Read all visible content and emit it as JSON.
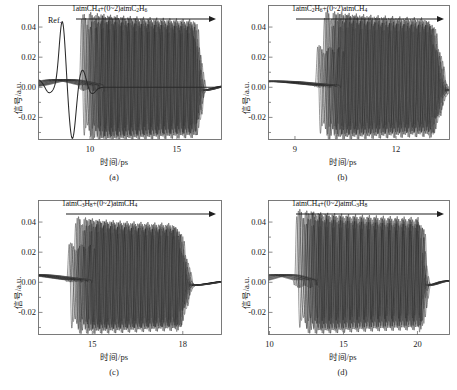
{
  "figure": {
    "type": "multi-panel-line-chart",
    "panels_layout": "2x2",
    "background": "#ffffff",
    "line_color": "#4a4a4a",
    "axis_color": "#6d6d6d"
  },
  "common": {
    "ylabel": "信号/a.u.",
    "xlabel": "时间/ps",
    "yticks": [
      "0.04",
      "0.02",
      "0.00",
      "-0.02"
    ],
    "ytick_values": [
      0.04,
      0.02,
      0.0,
      -0.02
    ],
    "ylim": [
      -0.035,
      0.05
    ],
    "reference_label": "Ref."
  },
  "panels": [
    {
      "tag": "(a)",
      "annotation": "1atmCH4+(0~2)atmC2H6",
      "annotation_parts": [
        {
          "t": "1atmCH"
        },
        {
          "t": "4",
          "sub": true
        },
        {
          "t": "+(0~2)atmC"
        },
        {
          "t": "2",
          "sub": true
        },
        {
          "t": "H"
        },
        {
          "t": "6",
          "sub": true
        }
      ],
      "xticks": [
        "10",
        "15"
      ],
      "xtick_values": [
        10,
        15
      ],
      "xlim": [
        7.0,
        17.6
      ],
      "has_reference": true,
      "reference_peak_time": 8.4,
      "burst_start": 9.3,
      "burst_span": [
        9.3,
        16.2
      ],
      "n_traces": 18,
      "trace_shift_per_step": 0.085,
      "osc_period_ps": 0.38,
      "amp_positive": 0.044,
      "amp_negative": -0.032,
      "precursor_bump": 0.005
    },
    {
      "tag": "(b)",
      "annotation": "1atmC2H6+(0~2)atmCH4",
      "annotation_parts": [
        {
          "t": "1atmC"
        },
        {
          "t": "2",
          "sub": true
        },
        {
          "t": "H"
        },
        {
          "t": "6",
          "sub": true
        },
        {
          "t": "+(0~2)atmCH"
        },
        {
          "t": "4",
          "sub": true
        }
      ],
      "xticks": [
        "9",
        "12"
      ],
      "xtick_values": [
        9,
        12
      ],
      "xlim": [
        8.2,
        13.6
      ],
      "has_reference": false,
      "burst_start": 9.55,
      "burst_span": [
        9.55,
        13.1
      ],
      "n_traces": 18,
      "trace_shift_per_step": 0.045,
      "osc_period_ps": 0.215,
      "amp_positive": 0.045,
      "amp_negative": -0.031,
      "precursor_bump": 0.004
    },
    {
      "tag": "(c)",
      "annotation": "1atmC3H8+(0~2)atmCH4",
      "annotation_parts": [
        {
          "t": "1atmC"
        },
        {
          "t": "3",
          "sub": true
        },
        {
          "t": "H"
        },
        {
          "t": "8",
          "sub": true
        },
        {
          "t": "+(0~2)atmCH"
        },
        {
          "t": "4",
          "sub": true
        }
      ],
      "xticks": [
        "15",
        "18"
      ],
      "xtick_values": [
        15,
        18
      ],
      "xlim": [
        13.2,
        19.3
      ],
      "has_reference": false,
      "burst_start": 14.1,
      "burst_span": [
        14.1,
        17.9
      ],
      "n_traces": 18,
      "trace_shift_per_step": 0.05,
      "osc_period_ps": 0.23,
      "amp_positive": 0.038,
      "amp_negative": -0.031,
      "precursor_bump": 0.005
    },
    {
      "tag": "(d)",
      "annotation": "1atmCH4+(0~2)atmC3H8",
      "annotation_parts": [
        {
          "t": "1atmCH"
        },
        {
          "t": "4",
          "sub": true
        },
        {
          "t": "+(0~2)atmC"
        },
        {
          "t": "3",
          "sub": true
        },
        {
          "t": "H"
        },
        {
          "t": "8",
          "sub": true
        }
      ],
      "xticks": [
        "10",
        "15",
        "20"
      ],
      "xtick_values": [
        10,
        15,
        20
      ],
      "xlim": [
        9.9,
        22.2
      ],
      "has_reference": false,
      "burst_start": 11.6,
      "burst_span": [
        11.6,
        20.4
      ],
      "n_traces": 16,
      "trace_shift_per_step": 0.11,
      "osc_period_ps": 0.47,
      "amp_positive": 0.042,
      "amp_negative": -0.03,
      "precursor_bump": 0.005
    }
  ],
  "chart_data": {
    "type": "line",
    "title": "",
    "xlabel": "时间/ps",
    "ylabel": "信号/a.u.",
    "ylim": [
      -0.035,
      0.05
    ],
    "grid": false,
    "legend": "none",
    "subplots": [
      {
        "tag": "(a)",
        "annotation": "1atmCH4+(0~2)atmC2H6",
        "xlim": [
          7.0,
          17.6
        ],
        "xticks": [
          10,
          15
        ],
        "yticks": [
          0.04,
          0.02,
          0.0,
          -0.02
        ],
        "series_count": 18,
        "series_description": "Overlaid THz time-domain waveforms; each trace corresponds to an increasing buffer-gas pressure from 0 to 2 atm, producing a progressive time delay of the free-induction-decay oscillation burst.",
        "reference_trace": {
          "name": "Ref.",
          "peak_time_ps": 8.4,
          "peak_amplitude": 0.044,
          "trough_time_ps": 9.0,
          "trough_amplitude": -0.034
        },
        "burst_onset_ps": 9.3,
        "burst_end_ps": 16.2,
        "oscillation_period_ps": 0.38,
        "amplitude_max": 0.044,
        "amplitude_min": -0.032
      },
      {
        "tag": "(b)",
        "annotation": "1atmC2H6+(0~2)atmCH4",
        "xlim": [
          8.2,
          13.6
        ],
        "xticks": [
          9,
          12
        ],
        "yticks": [
          0.04,
          0.02,
          0.0,
          -0.02
        ],
        "series_count": 18,
        "series_description": "Overlaid THz waveforms with increasing CH4 pressure added to 1 atm C2H6.",
        "burst_onset_ps": 9.55,
        "burst_end_ps": 13.1,
        "oscillation_period_ps": 0.215,
        "amplitude_max": 0.045,
        "amplitude_min": -0.031
      },
      {
        "tag": "(c)",
        "annotation": "1atmC3H8+(0~2)atmCH4",
        "xlim": [
          13.2,
          19.3
        ],
        "xticks": [
          15,
          18
        ],
        "yticks": [
          0.04,
          0.02,
          0.0,
          -0.02
        ],
        "series_count": 18,
        "series_description": "Overlaid THz waveforms with increasing CH4 pressure added to 1 atm C3H8.",
        "burst_onset_ps": 14.1,
        "burst_end_ps": 17.9,
        "oscillation_period_ps": 0.23,
        "amplitude_max": 0.038,
        "amplitude_min": -0.031
      },
      {
        "tag": "(d)",
        "annotation": "1atmCH4+(0~2)atmC3H8",
        "xlim": [
          9.9,
          22.2
        ],
        "xticks": [
          10,
          15,
          20
        ],
        "yticks": [
          0.04,
          0.02,
          0.0,
          -0.02
        ],
        "series_count": 16,
        "series_description": "Overlaid THz waveforms with increasing C3H8 pressure added to 1 atm CH4.",
        "burst_onset_ps": 11.6,
        "burst_end_ps": 20.4,
        "oscillation_period_ps": 0.47,
        "amplitude_max": 0.042,
        "amplitude_min": -0.03
      }
    ]
  }
}
